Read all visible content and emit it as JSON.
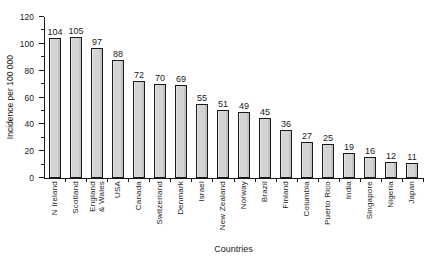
{
  "chart_data": {
    "type": "bar",
    "title": "",
    "xlabel": "Countries",
    "ylabel": "Incidence per 100 000",
    "categories": [
      "N Ireland",
      "Scotland",
      "England\n& Wales",
      "USA",
      "Canada",
      "Switzerland",
      "Denmark",
      "Israel",
      "New Zealand",
      "Norway",
      "Brazil",
      "Finland",
      "Columbia",
      "Puerto Rico",
      "India",
      "Singapore",
      "Nigeria",
      "Japan"
    ],
    "values": [
      104,
      105,
      97,
      88,
      72,
      70,
      69,
      55,
      51,
      49,
      45,
      36,
      27,
      25,
      19,
      16,
      12,
      11
    ],
    "ylim": [
      0,
      120
    ],
    "ytick_step": 20,
    "minor_ticks": true,
    "grid": false,
    "legend_position": "none",
    "bar_fill": "#d4d4d4",
    "bar_border": "#1a1a1a",
    "axis_color": "#1a1a1a",
    "text_color": "#1a1a1a",
    "background": "#ffffff"
  }
}
